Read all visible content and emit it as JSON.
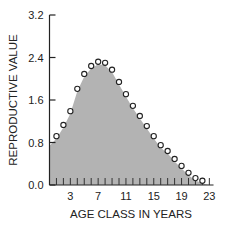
{
  "chart_data": {
    "type": "area",
    "title": "",
    "xlabel": "AGE CLASS IN YEARS",
    "ylabel": "REPRODUCTIVE VALUE",
    "xlim": [
      0,
      24
    ],
    "ylim": [
      0.0,
      3.2
    ],
    "x_ticks": [
      3,
      7,
      11,
      15,
      19,
      23
    ],
    "x_minor_ticks": [
      1,
      2,
      3,
      4,
      5,
      6,
      7,
      8,
      9,
      10,
      11,
      12,
      13,
      14,
      15,
      16,
      17,
      18,
      19,
      20,
      21,
      22,
      23
    ],
    "y_ticks": [
      "0.0",
      "0.8",
      "1.6",
      "2.4",
      "3.2"
    ],
    "grid": false,
    "legend": null,
    "area_start_value": 0.74,
    "fill_color": "#b3b3b3",
    "marker": "open-circle",
    "series": [
      {
        "name": "Reproductive value",
        "x": [
          1,
          2,
          3,
          4,
          5,
          6,
          7,
          8,
          9,
          10,
          11,
          12,
          13,
          14,
          15,
          16,
          17,
          18,
          19,
          20,
          21,
          22
        ],
        "values": [
          0.92,
          1.13,
          1.39,
          1.81,
          2.09,
          2.24,
          2.32,
          2.3,
          2.17,
          1.94,
          1.71,
          1.49,
          1.3,
          1.11,
          0.92,
          0.75,
          0.64,
          0.49,
          0.36,
          0.23,
          0.13,
          0.08
        ]
      }
    ]
  }
}
